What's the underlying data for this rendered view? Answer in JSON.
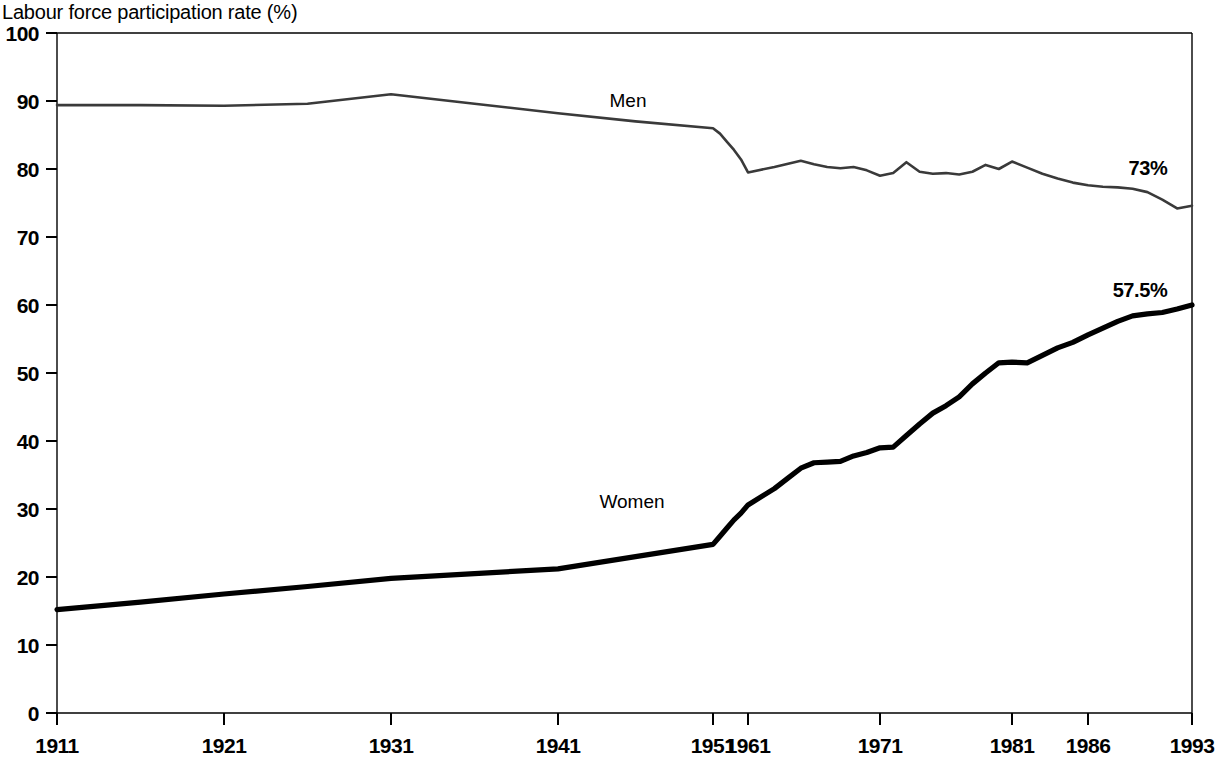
{
  "chart_data": {
    "type": "line",
    "title": "Labour force participation rate (%)",
    "xlabel": "",
    "ylabel": "",
    "ylim": [
      0,
      100
    ],
    "yticks": [
      0,
      10,
      20,
      30,
      40,
      50,
      60,
      70,
      80,
      90,
      100
    ],
    "xticks": [
      1911,
      1921,
      1931,
      1941,
      1951,
      1961,
      1971,
      1981,
      1986,
      1993
    ],
    "xtick_labels": [
      "1911",
      "1921",
      "1931",
      "1941",
      "1951",
      "1961",
      "1971",
      "1981",
      "1986",
      "1993"
    ],
    "xlim": [
      1911,
      1993
    ],
    "grid": false,
    "legend_position": "inline-annotation",
    "series": [
      {
        "name": "Men",
        "label": "Men",
        "color": "#3a3a3a",
        "x": [
          1911,
          1916,
          1921,
          1926,
          1931,
          1936,
          1941,
          1946,
          1951,
          1953,
          1955,
          1957,
          1959,
          1961,
          1963,
          1965,
          1966,
          1967,
          1968,
          1969,
          1970,
          1971,
          1972,
          1973,
          1974,
          1975,
          1976,
          1977,
          1978,
          1979,
          1980,
          1981,
          1982,
          1983,
          1984,
          1985,
          1986,
          1987,
          1988,
          1989,
          1990,
          1991,
          1992,
          1993
        ],
        "values": [
          89.4,
          89.4,
          89.3,
          89.6,
          91.0,
          89.6,
          88.2,
          87.0,
          86.0,
          85.2,
          84.0,
          82.8,
          81.4,
          79.5,
          80.3,
          81.2,
          80.7,
          80.3,
          80.1,
          80.3,
          79.8,
          79.0,
          79.4,
          81.0,
          79.6,
          79.3,
          79.4,
          79.2,
          79.6,
          80.6,
          80.0,
          81.1,
          80.2,
          79.3,
          78.6,
          78.0,
          77.6,
          77.4,
          77.3,
          77.1,
          76.6,
          75.5,
          74.2,
          74.6
        ],
        "end_label": "73%"
      },
      {
        "name": "Women",
        "label": "Women",
        "color": "#000000",
        "x": [
          1911,
          1916,
          1921,
          1926,
          1931,
          1936,
          1941,
          1946,
          1951,
          1953,
          1955,
          1957,
          1959,
          1961,
          1963,
          1964,
          1965,
          1966,
          1967,
          1968,
          1969,
          1970,
          1971,
          1972,
          1973,
          1974,
          1975,
          1976,
          1977,
          1978,
          1979,
          1980,
          1981,
          1982,
          1983,
          1984,
          1985,
          1986,
          1987,
          1988,
          1989,
          1990,
          1991,
          1992,
          1993
        ],
        "values": [
          15.2,
          16.3,
          17.5,
          18.6,
          19.8,
          20.5,
          21.2,
          23.0,
          24.8,
          26.0,
          27.2,
          28.4,
          29.4,
          30.6,
          33.0,
          34.5,
          36.0,
          36.8,
          36.9,
          37.0,
          37.8,
          38.3,
          39.0,
          39.1,
          40.8,
          42.5,
          44.1,
          45.2,
          46.5,
          48.4,
          50.0,
          51.5,
          51.6,
          51.5,
          52.6,
          53.7,
          54.5,
          55.6,
          56.6,
          57.6,
          58.4,
          58.7,
          58.9,
          59.4,
          60.0
        ],
        "end_label": "57.5%"
      }
    ]
  },
  "annotations": {
    "men_end": "73%",
    "women_end": "57.5%",
    "men_series": "Men",
    "women_series": "Women"
  }
}
